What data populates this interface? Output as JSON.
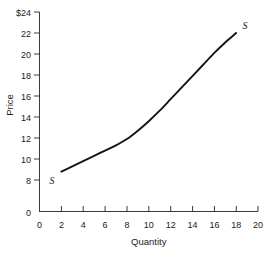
{
  "chart_data": {
    "type": "line",
    "title": "",
    "xlabel": "Quantity",
    "ylabel": "Price",
    "xlim": [
      0,
      20
    ],
    "ylim": [
      8,
      24
    ],
    "grid": false,
    "legend": "none",
    "y_axis_break": true,
    "x_ticks": [
      "0",
      "2",
      "4",
      "6",
      "8",
      "10",
      "12",
      "14",
      "16",
      "18",
      "20"
    ],
    "y_ticks": [
      "0",
      "8",
      "10",
      "12",
      "14",
      "16",
      "18",
      "20",
      "22",
      "$24"
    ],
    "series": [
      {
        "name": "S",
        "label_start": "S",
        "label_end": "S",
        "x": [
          2,
          3,
          4,
          5,
          6,
          7,
          8,
          9,
          10,
          11,
          12,
          13,
          14,
          15,
          16,
          17,
          18
        ],
        "y": [
          8.8,
          9.3,
          9.8,
          10.3,
          10.8,
          11.3,
          11.9,
          12.7,
          13.6,
          14.6,
          15.7,
          16.8,
          17.9,
          19.0,
          20.1,
          21.1,
          22.0
        ]
      }
    ]
  },
  "axis": {
    "y_label": "Price",
    "x_label": "Quantity",
    "y_top_label": "$24"
  },
  "labels": {
    "curve_lower": "S",
    "curve_upper": "S"
  },
  "colors": {
    "curve": "#141414",
    "axis": "#3a3a3a",
    "text": "#1a1a1a",
    "background": "#ffffff"
  }
}
